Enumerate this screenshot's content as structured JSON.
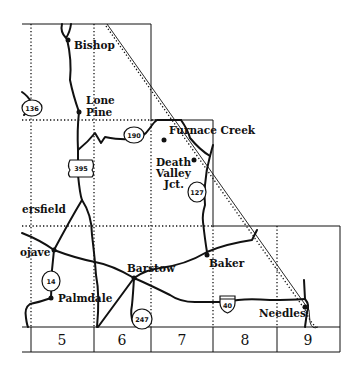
{
  "map": {
    "cities": {
      "bishop": "Bishop",
      "lone_pine_1": "Lone",
      "lone_pine_2": "Pine",
      "furnace_creek": "Furnace Creek",
      "death_valley_1": "Death",
      "death_valley_2": "Valley",
      "death_valley_3": "Jct.",
      "bakersfield": "ersfield",
      "mojave": "ojave",
      "palmdale": "Palmdale",
      "barstow": "Barstow",
      "baker": "Baker",
      "needles": "Needles"
    },
    "routes": {
      "r136": "136",
      "r190": "190",
      "r395": "395",
      "r127": "127",
      "r14": "14",
      "r247": "247",
      "i40": "40"
    },
    "grid_columns": [
      "5",
      "6",
      "7",
      "8",
      "9"
    ],
    "colors": {
      "ink": "#111111",
      "background": "#ffffff"
    }
  }
}
